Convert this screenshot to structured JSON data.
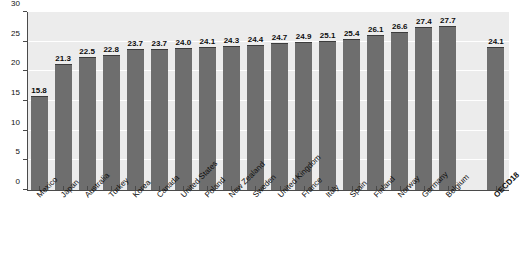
{
  "chart_data": {
    "type": "bar",
    "title": "",
    "xlabel": "",
    "ylabel": "",
    "ylim": [
      0,
      30
    ],
    "ytick_values": [
      0,
      5,
      10,
      15,
      20,
      25,
      30
    ],
    "ytick_labels": [
      "0",
      "5",
      "10",
      "15",
      "20",
      "25",
      "30"
    ],
    "grid": true,
    "grid_orientation": "horizontal",
    "legend": false,
    "bar_color": "#6e6e6e",
    "plot_background": "#ececec",
    "gridline_color": "#ffffff",
    "value_label_format": "one-decimal",
    "categories": [
      "Mexico",
      "Japan",
      "Australia",
      "Turkey",
      "Korea",
      "Canada",
      "United States",
      "Poland",
      "New Zealand",
      "Sweden",
      "United Kingdom",
      "France",
      "Italy",
      "Spain",
      "Finland",
      "Norway",
      "Germany",
      "Belgium",
      "OECD18"
    ],
    "values": [
      15.8,
      21.3,
      22.5,
      22.8,
      23.7,
      23.7,
      24.0,
      24.1,
      24.3,
      24.4,
      24.7,
      24.9,
      25.1,
      25.4,
      26.1,
      26.6,
      27.4,
      27.7,
      24.1
    ],
    "value_labels": [
      "15.8",
      "21.3",
      "22.5",
      "22.8",
      "23.7",
      "23.7",
      "24.0",
      "24.1",
      "24.3",
      "24.4",
      "24.7",
      "24.9",
      "25.1",
      "25.4",
      "26.1",
      "26.6",
      "27.4",
      "27.7",
      "24.1"
    ],
    "emphasis_index": 18,
    "gap_before_index": 18
  }
}
